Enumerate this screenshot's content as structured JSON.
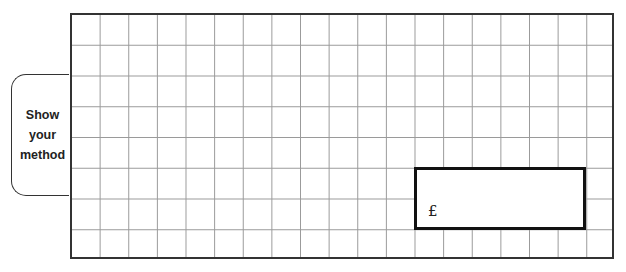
{
  "method_tab": {
    "lines": [
      "Show",
      "your",
      "method"
    ]
  },
  "grid": {
    "columns": 19,
    "rows": 8
  },
  "answer_box": {
    "currency_symbol": "£",
    "value": ""
  },
  "colors": {
    "grid_line": "#9a9a9a",
    "border": "#333333",
    "answer_border": "#111111"
  }
}
